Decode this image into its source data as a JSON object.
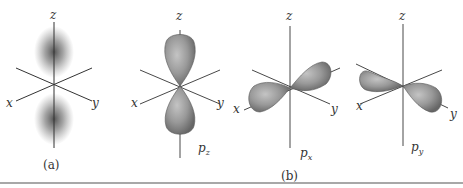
{
  "figure": {
    "panels": [
      {
        "id": "a",
        "caption": "(a)",
        "axes": {
          "x": "x",
          "y": "y",
          "z": "z"
        },
        "description": "s-like density cloud rendering of p orbital (dot density)"
      },
      {
        "id": "b",
        "caption": "(b)",
        "orbitals": [
          {
            "name": "pz",
            "main": "p",
            "sub": "z",
            "axes": {
              "x": "x",
              "y": "y",
              "z": "z"
            }
          },
          {
            "name": "px",
            "main": "p",
            "sub": "x",
            "axes": {
              "x": "x",
              "y": "y",
              "z": "z"
            }
          },
          {
            "name": "py",
            "main": "p",
            "sub": "y",
            "axes": {
              "x": "x",
              "y": "y",
              "z": "z"
            }
          }
        ]
      }
    ],
    "colors": {
      "axis": "#333333",
      "lobe_fill": "#9a9a9a",
      "lobe_dark": "#6e6e6e",
      "cloud": "#555555",
      "rule": "#a8a8a8"
    }
  }
}
